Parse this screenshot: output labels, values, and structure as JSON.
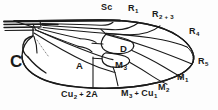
{
  "figure": {
    "background_color": "#fdfdfd",
    "line_color": "#1a1a1a",
    "label_color": "#1a1a1a"
  },
  "labels": {
    "sc": {
      "text": "Sc",
      "sub": "",
      "x": 101,
      "y": 3,
      "kind": "vein"
    },
    "r1": {
      "text": "R",
      "sub": "1",
      "x": 128,
      "y": 4,
      "kind": "vein"
    },
    "r23": {
      "text": "R",
      "sub": "2 + 3",
      "x": 152,
      "y": 10,
      "kind": "vein"
    },
    "r4": {
      "text": "R",
      "sub": "4",
      "x": 189,
      "y": 27,
      "kind": "vein"
    },
    "r5": {
      "text": "R",
      "sub": "5",
      "x": 198,
      "y": 57,
      "kind": "vein"
    },
    "m1": {
      "text": "M",
      "sub": "1",
      "x": 177,
      "y": 73,
      "kind": "vein"
    },
    "m2": {
      "text": "M",
      "sub": "2",
      "x": 158,
      "y": 83,
      "kind": "vein"
    },
    "m3_cu1": {
      "text": "M",
      "sub": "3",
      "suffix_text": "Cu",
      "suffix_sub": "1",
      "x": 121,
      "y": 89,
      "kind": "vein"
    },
    "cu2_2a": {
      "text": "Cu",
      "sub": "2",
      "suffix_text": "2A",
      "suffix_sub": "",
      "x": 61,
      "y": 90,
      "kind": "vein"
    },
    "cell_c": {
      "text": "C",
      "sub": "",
      "x": 10,
      "y": 53,
      "kind": "cell-large"
    },
    "cell_a": {
      "text": "A",
      "sub": "",
      "x": 76,
      "y": 61,
      "kind": "cell"
    },
    "cell_d": {
      "text": "D",
      "sub": "",
      "x": 120,
      "y": 44,
      "kind": "cell"
    },
    "cell_m3": {
      "text": "M",
      "sub": "3",
      "x": 115,
      "y": 60,
      "kind": "cell"
    }
  },
  "label_list": [
    "Sc",
    "R1",
    "R2 + 3",
    "R4",
    "R5",
    "M1",
    "M2",
    "M3 + Cu1",
    "Cu2 + 2A",
    "C",
    "A",
    "D",
    "M3"
  ]
}
